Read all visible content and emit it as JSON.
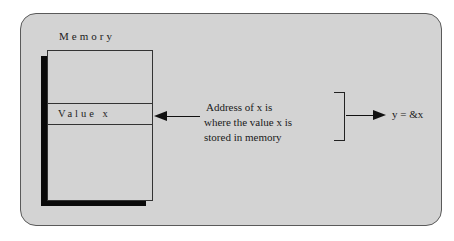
{
  "diagram": {
    "memory": {
      "title": "Memory",
      "cell_label": "Value x"
    },
    "annotation": {
      "lines": [
        "Address of x is",
        "where the value x is",
        "stored in memory"
      ]
    },
    "result": {
      "expression": "y = &x"
    },
    "colors": {
      "panel_background": "#d3d3d3",
      "panel_border": "#5a5a5a",
      "shadow": "#0a0a0a",
      "line": "#111111"
    }
  }
}
